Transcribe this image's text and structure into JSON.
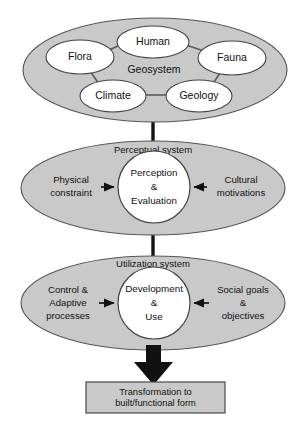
{
  "diagram": {
    "colors": {
      "system_fill": "#c9c9c9",
      "node_fill": "#ffffff",
      "outline": "#555555",
      "arrow": "#111111",
      "box_fill": "#c9c9c9"
    },
    "systems": [
      {
        "id": "geosystem",
        "label": "Geosystem",
        "nodes": [
          {
            "id": "flora",
            "label": "Flora"
          },
          {
            "id": "human",
            "label": "Human"
          },
          {
            "id": "fauna",
            "label": "Fauna"
          },
          {
            "id": "climate",
            "label": "Climate"
          },
          {
            "id": "geology",
            "label": "Geology"
          }
        ]
      },
      {
        "id": "perceptual",
        "label": "Perceptual system",
        "core": {
          "line1": "Perception",
          "line2": "&",
          "line3": "Evaluation"
        },
        "left_input": {
          "line1": "Physical",
          "line2": "constraint"
        },
        "right_input": {
          "line1": "Cultural",
          "line2": "motivations"
        }
      },
      {
        "id": "utilization",
        "label": "Utilization system",
        "core": {
          "line1": "Development",
          "line2": "&",
          "line3": "Use"
        },
        "left_input": {
          "line1": "Control &",
          "line2": "Adaptive",
          "line3": "processes"
        },
        "right_input": {
          "line1": "Social goals",
          "line2": "&",
          "line3": "objectives"
        }
      }
    ],
    "output_box": {
      "line1": "Transformation to",
      "line2": "built/functional form"
    }
  }
}
